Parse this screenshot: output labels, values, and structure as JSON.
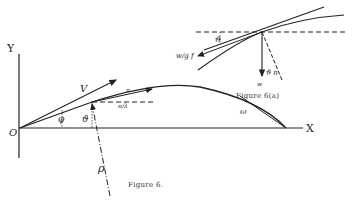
{
  "figure_main": {
    "caption": "Figure 6.",
    "axis_y_label": "Y",
    "axis_x_label": "X",
    "origin_label": "O",
    "velocity_label": "V",
    "angle_phi_label": "φ",
    "angle_theta_label": "ϑ",
    "angle_omega_label": "ω",
    "small_labels": [
      "π",
      "π/λ"
    ],
    "radius_label": "ρ"
  },
  "figure_inset": {
    "caption": "Figure 6(a)",
    "angle_label": "ϑ",
    "force_tangent_label": "w/g f",
    "force_normal_label": "ϑ n",
    "weight_label": "w"
  }
}
